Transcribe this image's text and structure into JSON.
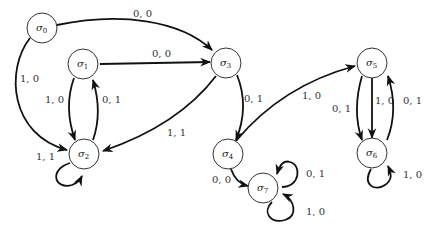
{
  "diagram": {
    "type": "finite-state-machine",
    "states": [
      {
        "id": "s0",
        "symbol": "σ",
        "sub": "0",
        "cx": 42,
        "cy": 28
      },
      {
        "id": "s1",
        "symbol": "σ",
        "sub": "1",
        "cx": 83,
        "cy": 64
      },
      {
        "id": "s2",
        "symbol": "σ",
        "sub": "2",
        "cx": 84,
        "cy": 154
      },
      {
        "id": "s3",
        "symbol": "σ",
        "sub": "3",
        "cx": 226,
        "cy": 63
      },
      {
        "id": "s4",
        "symbol": "σ",
        "sub": "4",
        "cx": 228,
        "cy": 154
      },
      {
        "id": "s5",
        "symbol": "σ",
        "sub": "5",
        "cx": 372,
        "cy": 63
      },
      {
        "id": "s6",
        "symbol": "σ",
        "sub": "6",
        "cx": 372,
        "cy": 153
      },
      {
        "id": "s7",
        "symbol": "σ",
        "sub": "7",
        "cx": 263,
        "cy": 188
      }
    ],
    "edges": [
      {
        "from": "s0",
        "to": "s3",
        "label": "0, 0"
      },
      {
        "from": "s0",
        "to": "s2",
        "label": "1, 0"
      },
      {
        "from": "s1",
        "to": "s3",
        "label": "0, 0"
      },
      {
        "from": "s1",
        "to": "s2",
        "label": "1, 0"
      },
      {
        "from": "s2",
        "to": "s1",
        "label": "0, 1"
      },
      {
        "from": "s2",
        "to": "s2",
        "label": "1, 1"
      },
      {
        "from": "s3",
        "to": "s2",
        "label": "1, 1"
      },
      {
        "from": "s3",
        "to": "s4",
        "label": "0, 1"
      },
      {
        "from": "s4",
        "to": "s5",
        "label": "1, 0"
      },
      {
        "from": "s4",
        "to": "s7",
        "label": "0, 0"
      },
      {
        "from": "s5",
        "to": "s6",
        "label": "0, 1"
      },
      {
        "from": "s5",
        "to": "s6",
        "label": "1, 0"
      },
      {
        "from": "s6",
        "to": "s5",
        "label": "0, 1"
      },
      {
        "from": "s6",
        "to": "s6",
        "label": "1, 0"
      },
      {
        "from": "s7",
        "to": "s7",
        "label": "0, 1"
      },
      {
        "from": "s7",
        "to": "s7",
        "label": "1, 0"
      }
    ]
  }
}
